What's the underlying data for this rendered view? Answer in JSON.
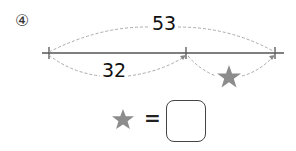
{
  "problem": {
    "number": "④"
  },
  "diagram": {
    "total_label": "53",
    "part_label": "32",
    "unknown_symbol": "star-icon",
    "colors": {
      "line": "#555555",
      "dashed_arc": "#aaaaaa",
      "star": "#8c8c8c"
    }
  },
  "equation": {
    "left_symbol": "star-icon",
    "operator": "=",
    "answer_value": ""
  }
}
